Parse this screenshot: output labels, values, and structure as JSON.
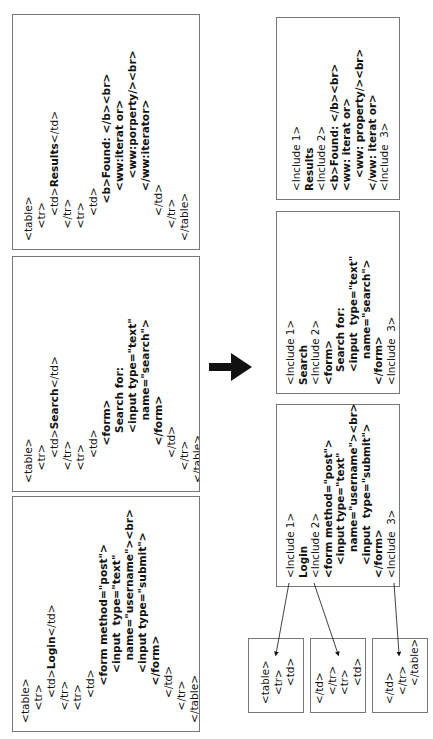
{
  "figure": {
    "arrow": "right-arrow"
  },
  "source_pages": [
    {
      "id": "results",
      "lines": [
        {
          "indent": 0,
          "text": "<table>"
        },
        {
          "indent": 1,
          "text": "<tr>"
        },
        {
          "indent": 2,
          "parts": [
            {
              "t": "<td>"
            },
            {
              "t": "Results",
              "b": true
            },
            {
              "t": "</td>"
            }
          ]
        },
        {
          "indent": 1,
          "text": "</tr>"
        },
        {
          "indent": 1,
          "text": "<tr>"
        },
        {
          "indent": 2,
          "text": "<td>"
        },
        {
          "indent": 3,
          "parts": [
            {
              "t": "<b>Found: </b><br>",
              "b": true
            }
          ]
        },
        {
          "indent": 4,
          "text": "<ww:iterat or>",
          "b": true
        },
        {
          "indent": 5,
          "text": "<ww:porperty/><br>",
          "b": true
        },
        {
          "indent": 4,
          "text": "</ww:iterator>",
          "b": true
        },
        {
          "indent": 2,
          "text": "</td>"
        },
        {
          "indent": 1,
          "text": "</tr>"
        },
        {
          "indent": 0,
          "text": "</table>"
        }
      ]
    },
    {
      "id": "search",
      "lines": [
        {
          "indent": 0,
          "text": "<table>"
        },
        {
          "indent": 1,
          "text": "<tr>"
        },
        {
          "indent": 2,
          "parts": [
            {
              "t": "<td>"
            },
            {
              "t": "Search",
              "b": true
            },
            {
              "t": "</td>"
            }
          ]
        },
        {
          "indent": 1,
          "text": "</tr>"
        },
        {
          "indent": 1,
          "text": "<tr>"
        },
        {
          "indent": 2,
          "text": "<td>"
        },
        {
          "indent": 3,
          "text": "<form>",
          "b": true
        },
        {
          "indent": 4,
          "text": "Search for:",
          "b": true
        },
        {
          "indent": 4,
          "text": "<input type=\"text\"",
          "b": true
        },
        {
          "indent": 5,
          "text": "name=\"search\">",
          "b": true
        },
        {
          "indent": 3,
          "text": "</form>",
          "b": true
        },
        {
          "indent": 2,
          "text": "</td>"
        },
        {
          "indent": 1,
          "text": "</tr>"
        },
        {
          "indent": 0,
          "text": "</table>"
        }
      ]
    },
    {
      "id": "login",
      "lines": [
        {
          "indent": 0,
          "text": "<table>"
        },
        {
          "indent": 1,
          "text": "<tr>"
        },
        {
          "indent": 2,
          "parts": [
            {
              "t": "<td>"
            },
            {
              "t": "Login",
              "b": true
            },
            {
              "t": "</td>"
            }
          ]
        },
        {
          "indent": 1,
          "text": "</tr>"
        },
        {
          "indent": 1,
          "text": "<tr>"
        },
        {
          "indent": 2,
          "text": "<td>"
        },
        {
          "indent": 3,
          "text": "<form method=\"post\">",
          "b": true
        },
        {
          "indent": 4,
          "text": "<input  type=\"text\"",
          "b": true
        },
        {
          "indent": 5,
          "text": "name=\"username\"><br>",
          "b": true
        },
        {
          "indent": 4,
          "text": "<input type=\"submit\">",
          "b": true
        },
        {
          "indent": 3,
          "text": "</form>",
          "b": true
        },
        {
          "indent": 2,
          "text": "</td>"
        },
        {
          "indent": 1,
          "text": "</tr>"
        },
        {
          "indent": 0,
          "text": "</table>"
        }
      ]
    }
  ],
  "result_pages": [
    {
      "id": "results",
      "lines": [
        {
          "indent": 0,
          "text": "<Include 1>"
        },
        {
          "indent": 0,
          "text": "Results",
          "b": true
        },
        {
          "indent": 0,
          "text": "<Include 2>"
        },
        {
          "indent": 0,
          "parts": [
            {
              "t": "<b>Found: </b><br>",
              "b": true
            }
          ]
        },
        {
          "indent": 0,
          "text": "<ww: iterat or>",
          "b": true
        },
        {
          "indent": 1,
          "text": "<ww: property/><br>",
          "b": true
        },
        {
          "indent": 0,
          "text": "</ww: iterat or>",
          "b": true
        },
        {
          "indent": 0,
          "text": "<Include  3>"
        }
      ]
    },
    {
      "id": "search",
      "lines": [
        {
          "indent": 0,
          "text": "<Include 1>"
        },
        {
          "indent": 0,
          "text": "Search",
          "b": true
        },
        {
          "indent": 0,
          "text": "<Include 2>"
        },
        {
          "indent": 0,
          "text": "<form>",
          "b": true
        },
        {
          "indent": 1,
          "text": "Search for:",
          "b": true
        },
        {
          "indent": 1,
          "text": "<input  type=\"text\"",
          "b": true
        },
        {
          "indent": 2,
          "text": "name=\"search\">",
          "b": true
        },
        {
          "indent": 0,
          "text": "</form>",
          "b": true
        },
        {
          "indent": 0,
          "text": "<Include  3>"
        }
      ]
    },
    {
      "id": "login",
      "lines": [
        {
          "indent": 0,
          "text": "<Include 1>"
        },
        {
          "indent": 0,
          "text": "Login",
          "b": true
        },
        {
          "indent": 0,
          "text": "<Include 2>"
        },
        {
          "indent": 0,
          "text": "<form method=\"post\">",
          "b": true
        },
        {
          "indent": 1,
          "text": "<input type=\"text\"",
          "b": true
        },
        {
          "indent": 2,
          "text": "name=\"username\"><br>",
          "b": true
        },
        {
          "indent": 1,
          "text": "<input  type=\"submit\">",
          "b": true
        },
        {
          "indent": 0,
          "text": "</form>",
          "b": true
        },
        {
          "indent": 0,
          "text": "<Include  3>"
        }
      ]
    }
  ],
  "include_fragments": [
    {
      "id": "include-1",
      "lines": [
        {
          "indent": 0,
          "text": "<table>"
        },
        {
          "indent": 1,
          "text": "<tr>"
        },
        {
          "indent": 2,
          "text": "<td>"
        }
      ]
    },
    {
      "id": "include-2",
      "lines": [
        {
          "indent": 0,
          "text": "</td>"
        },
        {
          "indent": 1,
          "text": "</tr>"
        },
        {
          "indent": 1,
          "text": "<tr>"
        },
        {
          "indent": 2,
          "text": "<td>"
        }
      ]
    },
    {
      "id": "include-3",
      "lines": [
        {
          "indent": 0,
          "text": "</td>"
        },
        {
          "indent": 1,
          "text": "</tr>"
        },
        {
          "indent": 2,
          "text": "</table>"
        }
      ]
    }
  ]
}
